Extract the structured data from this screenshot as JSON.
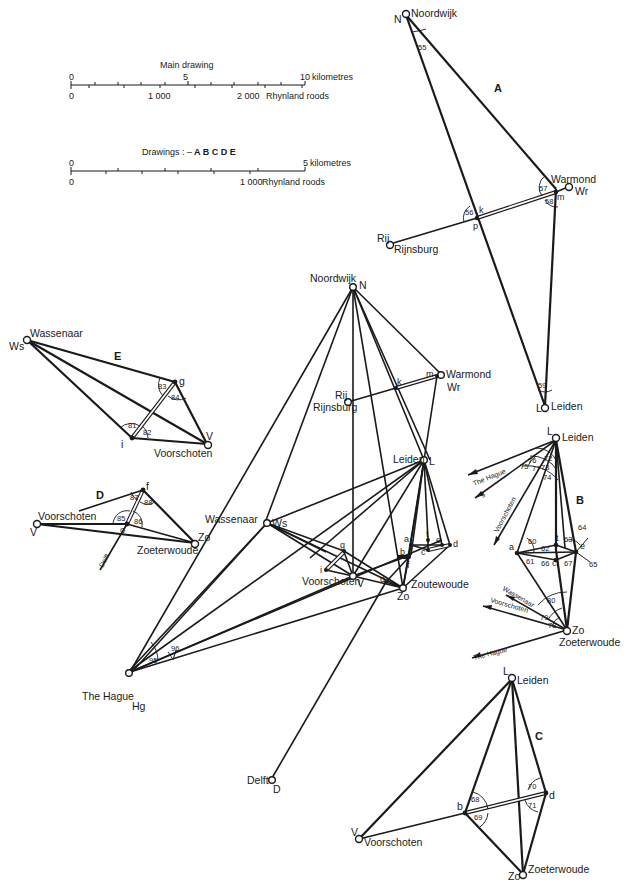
{
  "scale_bars": {
    "main": {
      "title": "Main drawing",
      "top_zero": "0",
      "top_mid": "5",
      "top_end": "10",
      "top_unit": "kilometres",
      "bottom_zero": "0",
      "bottom_mid": "1 000",
      "bottom_end": "2 000",
      "bottom_unit": "Rhynland roods"
    },
    "small": {
      "title_prefix": "Drawings : –",
      "title_letters": "A B C D E",
      "top_zero": "0",
      "top_end": "5",
      "top_unit": "kilometres",
      "bottom_zero": "0",
      "bottom_end": "1 000",
      "bottom_unit": "Rhynland roods"
    }
  },
  "drawing_A": {
    "letter": "A",
    "stations": {
      "N": {
        "code": "N",
        "name": "Noordwijk"
      },
      "Wr": {
        "code": "Wr",
        "name": "Warmond"
      },
      "Rij": {
        "code": "Rij",
        "name": "Rijnsburg"
      },
      "L": {
        "code": "L",
        "name": "Leiden"
      }
    },
    "points": {
      "k": "k",
      "p": "p",
      "m": "m"
    },
    "angles": [
      "55",
      "56",
      "57",
      "58",
      "59"
    ]
  },
  "drawing_E": {
    "letter": "E",
    "stations": {
      "Ws": {
        "code": "Ws",
        "name": "Wassenaar"
      },
      "V": {
        "code": "V",
        "name": "Voorschoten"
      }
    },
    "points": {
      "g": "g",
      "i": "i"
    },
    "angles": [
      "81",
      "82",
      "83",
      "84"
    ]
  },
  "drawing_D": {
    "letter": "D",
    "stations": {
      "V": {
        "code": "V",
        "name": "Voorschoten"
      },
      "Zo": {
        "code": "Zo",
        "name": "Zoeterwoude"
      }
    },
    "points": {
      "f": "f",
      "o": "o"
    },
    "direction": "Delft",
    "angles": [
      "85",
      "86",
      "87",
      "88"
    ]
  },
  "drawing_B": {
    "letter": "B",
    "stations": {
      "L": {
        "code": "L",
        "name": "Leiden"
      },
      "Zo": {
        "code": "Zo",
        "name": "Zoeterwoude"
      }
    },
    "points": {
      "a": "a",
      "t": "t",
      "e": "e",
      "c": "c"
    },
    "directions_from_L": [
      "The Hague",
      "g",
      "Voorschoten"
    ],
    "directions_from_Zo": [
      "Wassenaar",
      "Voorschoten",
      "The Hague"
    ],
    "angles_L": [
      "72",
      "73",
      "74",
      "75",
      "76",
      "77"
    ],
    "angles_centre": [
      "60",
      "61",
      "62",
      "63",
      "64",
      "65",
      "66",
      "67"
    ],
    "angles_Zo": [
      "78",
      "79",
      "80"
    ]
  },
  "drawing_C": {
    "letter": "C",
    "stations": {
      "L": {
        "code": "L",
        "name": "Leiden"
      },
      "V": {
        "code": "V",
        "name": "Voorschoten"
      },
      "Zo": {
        "code": "Zo",
        "name": "Zoeterwoude"
      }
    },
    "points": {
      "b": "b",
      "d": "d"
    },
    "angles": [
      "68",
      "69",
      "70",
      "71"
    ]
  },
  "main": {
    "stations": {
      "N": {
        "code": "N",
        "name": "Noordwijk"
      },
      "Wr": {
        "code": "Wr",
        "name": "Warmond"
      },
      "Rij": {
        "code": "Rij",
        "name": "Rijnsburg"
      },
      "L": {
        "code": "L",
        "name": "Leiden"
      },
      "Ws": {
        "code": "Ws",
        "name": "Wassenaar"
      },
      "V": {
        "code": "V",
        "name": "Voorschoten"
      },
      "Zo": {
        "code": "Zo",
        "name": "Zoutewoude"
      },
      "Hg": {
        "code": "Hg",
        "name": "The Hague"
      },
      "D": {
        "code": "D",
        "name": "Delft"
      }
    },
    "points": {
      "k": "k",
      "m": "m",
      "a": "a",
      "t": "t",
      "e": "e",
      "c": "c",
      "d": "d",
      "b": "b",
      "f": "f",
      "g": "g",
      "i": "i",
      "o": "o"
    },
    "angles": [
      "95",
      "96"
    ]
  }
}
